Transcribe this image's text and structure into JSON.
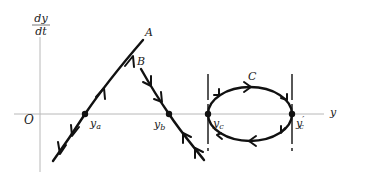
{
  "figure": {
    "type": "phase-line diagram",
    "axes": {
      "y_axis_label_numerator": "dy",
      "y_axis_label_denominator": "dt",
      "x_axis_label": "y",
      "origin_label": "O"
    },
    "trajectories": [
      {
        "id": "A",
        "label": "A",
        "shape": "line, positive slope",
        "equilibrium_label": "y",
        "equilibrium_subscript": "a",
        "flow": "away from equilibrium (unstable)"
      },
      {
        "id": "B",
        "label": "B",
        "shape": "line, negative slope",
        "equilibrium_label": "y",
        "equilibrium_subscript": "b",
        "flow": "toward equilibrium (stable)"
      },
      {
        "id": "C",
        "label": "C",
        "shape": "closed loop (limit cycle)",
        "equilibrium_labels": [
          {
            "text": "y",
            "subscript": "c"
          },
          {
            "text": "y",
            "subscript": "c",
            "prime": "′"
          }
        ],
        "flow": "clockwise around loop"
      }
    ],
    "colors": {
      "curve": "#111111",
      "axis": "#b8b8b8",
      "text": "#222222"
    }
  }
}
